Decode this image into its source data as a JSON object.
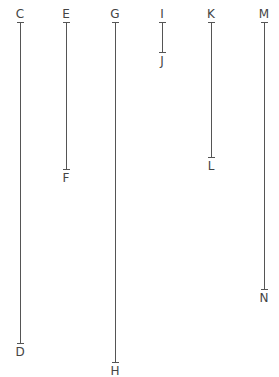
{
  "segments": [
    {
      "start_label": "C",
      "end_label": "D",
      "x": 20,
      "y1": 22,
      "y2": 343
    },
    {
      "start_label": "E",
      "end_label": "F",
      "x": 66,
      "y1": 22,
      "y2": 169
    },
    {
      "start_label": "G",
      "end_label": "H",
      "x": 115,
      "y1": 22,
      "y2": 362
    },
    {
      "start_label": "I",
      "end_label": "J",
      "x": 162,
      "y1": 22,
      "y2": 52
    },
    {
      "start_label": "K",
      "end_label": "L",
      "x": 211,
      "y1": 22,
      "y2": 157
    },
    {
      "start_label": "M",
      "end_label": "N",
      "x": 264,
      "y1": 22,
      "y2": 289
    }
  ],
  "style": {
    "line_color": "#555555",
    "label_color": "#444444"
  }
}
